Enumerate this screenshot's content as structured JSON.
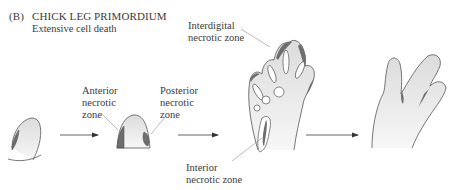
{
  "figure": {
    "panel_label": "(B)",
    "title": "CHICK LEG PRIMORDIUM",
    "subtitle": "Extensive cell death"
  },
  "labels": {
    "anterior": [
      "Anterior",
      "necrotic",
      "zone"
    ],
    "posterior": [
      "Posterior",
      "necrotic",
      "zone"
    ],
    "interdigital": [
      "Interdigital",
      "necrotic zone"
    ],
    "interior": [
      "Interior",
      "necrotic zone"
    ]
  },
  "stages": [
    {
      "name": "early-limb-bud"
    },
    {
      "name": "limb-bud-with-anterior-posterior-zones"
    },
    {
      "name": "foot-plate-with-interdigital-zones"
    },
    {
      "name": "separated-digits"
    }
  ],
  "colors": {
    "tissue_fill": "#ececec",
    "necrotic_fill": "#6e6e6e",
    "outline": "#555555",
    "text": "#3a3a3a"
  }
}
